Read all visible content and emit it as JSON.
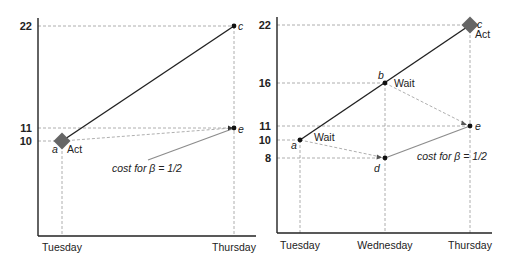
{
  "left_panel": {
    "y_ticks": [
      {
        "label": "22",
        "y": 26
      },
      {
        "label": "11",
        "y": 128
      },
      {
        "label": "10",
        "y": 141
      }
    ],
    "x_ticks": [
      {
        "label": "Tuesday",
        "x": 62
      },
      {
        "label": "Thursday",
        "x": 234
      }
    ],
    "points": {
      "a": {
        "name": "a",
        "action": "Act"
      },
      "c": {
        "name": "c"
      },
      "e": {
        "name": "e"
      }
    },
    "annotation": "cost for β = 1/2"
  },
  "right_panel": {
    "y_ticks": [
      {
        "label": "22",
        "y": 25
      },
      {
        "label": "16",
        "y": 83
      },
      {
        "label": "11",
        "y": 126
      },
      {
        "label": "10",
        "y": 140
      },
      {
        "label": "8",
        "y": 158
      }
    ],
    "x_ticks": [
      {
        "label": "Tuesday",
        "x": 300
      },
      {
        "label": "Wednesday",
        "x": 385
      },
      {
        "label": "Thursday",
        "x": 470
      }
    ],
    "points": {
      "a": {
        "name": "a",
        "action": "Wait"
      },
      "b": {
        "name": "b",
        "action": "Wait"
      },
      "c": {
        "name": "c",
        "action": "Act"
      },
      "d": {
        "name": "d"
      },
      "e": {
        "name": "e"
      }
    },
    "annotation": "cost for β = 1/2"
  },
  "colors": {
    "line": "#222222",
    "grid": "#9a9a9a",
    "cost_line": "#8c8c8c",
    "diamond": "#666666"
  }
}
